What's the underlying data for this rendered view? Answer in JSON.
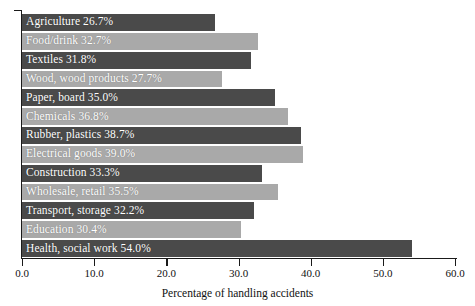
{
  "chart": {
    "type": "bar",
    "orientation": "horizontal"
  },
  "axis": {
    "x_title": "Percentage of handling accidents",
    "ticks": [
      "0.0",
      "10.0",
      "20.0",
      "30.0",
      "40.0",
      "50.0",
      "60.0"
    ],
    "tick_values": [
      0,
      10,
      20,
      30,
      40,
      50,
      60
    ]
  },
  "colors": {
    "bar_dark": "#4a4a4a",
    "bar_light": "#a9a9a9",
    "label_text": "#ffffff",
    "axis": "#1a1a1a",
    "background": "#ffffff"
  },
  "bars": [
    {
      "label": "Agriculture 26.7%",
      "category": "Agriculture",
      "value": 26.7,
      "shade": "dark"
    },
    {
      "label": "Food/drink 32.7%",
      "category": "Food/drink",
      "value": 32.7,
      "shade": "light"
    },
    {
      "label": "Textiles 31.8%",
      "category": "Textiles",
      "value": 31.8,
      "shade": "dark"
    },
    {
      "label": "Wood, wood products 27.7%",
      "category": "Wood, wood products",
      "value": 27.7,
      "shade": "light"
    },
    {
      "label": "Paper, board 35.0%",
      "category": "Paper, board",
      "value": 35.0,
      "shade": "dark"
    },
    {
      "label": "Chemicals 36.8%",
      "category": "Chemicals",
      "value": 36.8,
      "shade": "light"
    },
    {
      "label": "Rubber, plastics 38.7%",
      "category": "Rubber, plastics",
      "value": 38.7,
      "shade": "dark"
    },
    {
      "label": "Electrical goods 39.0%",
      "category": "Electrical goods",
      "value": 39.0,
      "shade": "light"
    },
    {
      "label": "Construction 33.3%",
      "category": "Construction",
      "value": 33.3,
      "shade": "dark"
    },
    {
      "label": "Wholesale, retail 35.5%",
      "category": "Wholesale, retail",
      "value": 35.5,
      "shade": "light"
    },
    {
      "label": "Transport, storage 32.2%",
      "category": "Transport, storage",
      "value": 32.2,
      "shade": "dark"
    },
    {
      "label": "Education 30.4%",
      "category": "Education",
      "value": 30.4,
      "shade": "light"
    },
    {
      "label": "Health, social work 54.0%",
      "category": "Health, social work",
      "value": 54.0,
      "shade": "dark"
    }
  ],
  "chart_data": {
    "type": "bar",
    "title": "",
    "subtitle": "",
    "xlabel": "Percentage of handling accidents",
    "ylabel": "",
    "xlim": [
      0,
      60
    ],
    "grid": false,
    "legend": "none",
    "orientation": "horizontal",
    "categories": [
      "Agriculture",
      "Food/drink",
      "Textiles",
      "Wood, wood products",
      "Paper, board",
      "Chemicals",
      "Rubber, plastics",
      "Electrical goods",
      "Construction",
      "Wholesale, retail",
      "Transport, storage",
      "Education",
      "Health, social work"
    ],
    "values": [
      26.7,
      32.7,
      31.8,
      27.7,
      35.0,
      36.8,
      38.7,
      39.0,
      33.3,
      35.5,
      32.2,
      30.4,
      54.0
    ],
    "data_labels": [
      "Agriculture 26.7%",
      "Food/drink 32.7%",
      "Textiles 31.8%",
      "Wood, wood products 27.7%",
      "Paper, board 35.0%",
      "Chemicals 36.8%",
      "Rubber, plastics 38.7%",
      "Electrical goods 39.0%",
      "Construction 33.3%",
      "Wholesale, retail 35.5%",
      "Transport, storage 32.2%",
      "Education 30.4%",
      "Health, social work 54.0%"
    ],
    "xticks": [
      0,
      10,
      20,
      30,
      40,
      50,
      60
    ],
    "xticklabels": [
      "0.0",
      "10.0",
      "20.0",
      "30.0",
      "40.0",
      "50.0",
      "60.0"
    ]
  }
}
